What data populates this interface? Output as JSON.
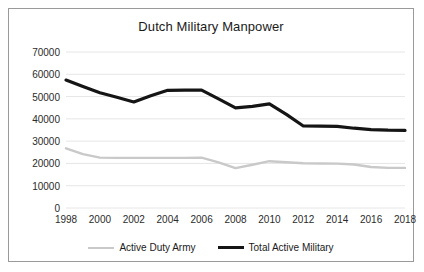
{
  "chart_data": {
    "type": "line",
    "title": "Dutch Military Manpower",
    "xlabel": "",
    "ylabel": "",
    "xlim": [
      1998,
      2018
    ],
    "ylim": [
      0,
      70000
    ],
    "ytick_values": [
      0,
      10000,
      20000,
      30000,
      40000,
      50000,
      60000,
      70000
    ],
    "ytick_labels": [
      "0",
      "10000",
      "20000",
      "30000",
      "40000",
      "50000",
      "60000",
      "70000"
    ],
    "xtick_values": [
      1998,
      2000,
      2002,
      2004,
      2006,
      2008,
      2010,
      2012,
      2014,
      2016,
      2018
    ],
    "xtick_labels": [
      "1998",
      "2000",
      "2002",
      "2004",
      "2006",
      "2008",
      "2010",
      "2012",
      "2014",
      "2016",
      "2018"
    ],
    "grid": true,
    "grid_axis": "y",
    "legend_position": "bottom",
    "x": [
      1998,
      1999,
      2000,
      2001,
      2002,
      2003,
      2004,
      2005,
      2006,
      2007,
      2008,
      2009,
      2010,
      2011,
      2012,
      2013,
      2014,
      2015,
      2016,
      2017,
      2018
    ],
    "series": [
      {
        "name": "Active Duty Army",
        "color": "#c9c9c9",
        "width": 2.4,
        "values": [
          26800,
          24200,
          22600,
          22500,
          22500,
          22500,
          22500,
          22500,
          22600,
          20500,
          17900,
          19400,
          21000,
          20500,
          20100,
          20000,
          19900,
          19500,
          18400,
          18000,
          18000
        ]
      },
      {
        "name": "Total Active Military",
        "color": "#151515",
        "width": 3.2,
        "values": [
          57400,
          54500,
          51700,
          49700,
          47600,
          50400,
          52800,
          52900,
          52900,
          49000,
          44900,
          45600,
          46700,
          42000,
          36800,
          36700,
          36600,
          35800,
          35200,
          34900,
          34800
        ]
      }
    ]
  },
  "legend": {
    "items": [
      {
        "label": "Active Duty Army",
        "color": "#c9c9c9",
        "thickness": "2px"
      },
      {
        "label": "Total Active Military",
        "color": "#151515",
        "thickness": "3px"
      }
    ]
  }
}
